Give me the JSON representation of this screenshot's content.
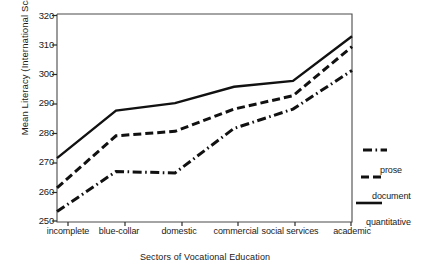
{
  "chart_data": {
    "type": "line",
    "title": "",
    "xlabel": "Sectors of Vocational Education",
    "ylabel": "Mean Literacy (International Scales)",
    "categories": [
      "incomplete",
      "blue-collar",
      "domestic",
      "commercial",
      "social services",
      "academic"
    ],
    "ylim": [
      250,
      320
    ],
    "yticks": [
      250,
      260,
      270,
      280,
      290,
      300,
      310,
      320
    ],
    "grid": false,
    "legend_position": "right",
    "series": [
      {
        "name": "prose",
        "style": "dash-dot",
        "values": [
          253.5,
          267.0,
          266.5,
          281.5,
          288.0,
          301.0
        ]
      },
      {
        "name": "document",
        "style": "dashed",
        "values": [
          261.5,
          279.0,
          280.5,
          288.0,
          292.5,
          309.0
        ]
      },
      {
        "name": "quantitative",
        "style": "solid",
        "values": [
          271.5,
          287.5,
          290.0,
          295.5,
          297.5,
          312.5
        ]
      }
    ]
  },
  "axis": {
    "y_tick_labels": [
      "320",
      "310",
      "300",
      "290",
      "280",
      "270",
      "260",
      "250"
    ],
    "x_tick_labels": [
      "incomplete",
      "blue-collar",
      "domestic",
      "commercial",
      "social services",
      "academic"
    ],
    "y_title": "Mean Literacy (International Scales)",
    "x_title": "Sectors of Vocational Education"
  },
  "legend": {
    "entries": [
      {
        "label": "prose",
        "style": "dash-dot"
      },
      {
        "label": "document",
        "style": "dashed"
      },
      {
        "label": "quantitative",
        "style": "solid"
      }
    ]
  },
  "colors": {
    "line": "#111111",
    "axis": "#444444",
    "background": "#ffffff"
  }
}
